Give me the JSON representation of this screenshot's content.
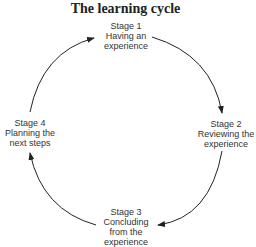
{
  "title": "The learning cycle",
  "stages": [
    {
      "lines": [
        "Stage 1",
        "Having an",
        "experience"
      ]
    },
    {
      "lines": [
        "Stage 2",
        "Reviewing the",
        "experience"
      ]
    },
    {
      "lines": [
        "Stage 3",
        "Concluding",
        "from the",
        "experience"
      ]
    },
    {
      "lines": [
        "Stage 4",
        "Planning the",
        "next steps"
      ]
    }
  ],
  "colors": {
    "line": "#222222",
    "text": "#333333"
  }
}
